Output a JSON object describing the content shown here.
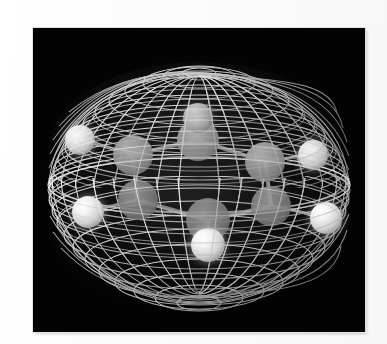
{
  "page": {
    "background_color": "#fdfdfd",
    "figure_background_color": "#030303",
    "alt_text": "Wireframe isosurface enclosing a benzene molecule, showing two electron-density lobes above and below the ring plane"
  },
  "figure": {
    "plate": {
      "x": 33,
      "y": 28,
      "width": 332,
      "height": 304
    },
    "molecule_formula": "C6H6",
    "molecule_name": "benzene",
    "surface_type": "wireframe isosurface",
    "lobe_count": 2,
    "lobes": [
      "upper lobe",
      "lower lobe"
    ],
    "mesh_color": "#d5d5d5",
    "carbon_color": "#8a8a8a",
    "hydrogen_color": "#f2f2f2",
    "bond_color": "#b9b9b9"
  },
  "chart_data": {
    "type": "scatter",
    "xlabel": "",
    "ylabel": "",
    "grid": false,
    "legend": "none",
    "xlim": [
      0,
      332
    ],
    "ylim": [
      0,
      304
    ],
    "annotations": [
      "wireframe isosurface, two lobes above and below the ring plane",
      "six carbon atoms form the planar hexagonal ring",
      "six hydrogen atoms point radially outward"
    ],
    "series": [
      {
        "name": "hydrogen",
        "label": "H",
        "count": 6,
        "radius": 14,
        "color": "#f2f2f2",
        "points": [
          {
            "id": "H1",
            "x": 47,
            "y": 112,
            "r": 15,
            "brightness": "mid"
          },
          {
            "id": "H2",
            "x": 55,
            "y": 184,
            "r": 16,
            "brightness": "bright"
          },
          {
            "id": "H3",
            "x": 165,
            "y": 90,
            "r": 15,
            "brightness": "dim"
          },
          {
            "id": "H4",
            "x": 175,
            "y": 217,
            "r": 17,
            "brightness": "bright"
          },
          {
            "id": "H5",
            "x": 280,
            "y": 127,
            "r": 15,
            "brightness": "mid"
          },
          {
            "id": "H6",
            "x": 293,
            "y": 190,
            "r": 16,
            "brightness": "bright"
          }
        ]
      },
      {
        "name": "carbon",
        "label": "C",
        "count": 6,
        "radius": 19,
        "color": "#8a8a8a",
        "points": [
          {
            "id": "C1",
            "x": 100,
            "y": 127,
            "r": 20,
            "brightness": "mid"
          },
          {
            "id": "C2",
            "x": 165,
            "y": 112,
            "r": 21,
            "brightness": "mid"
          },
          {
            "id": "C3",
            "x": 232,
            "y": 134,
            "r": 20,
            "brightness": "mid"
          },
          {
            "id": "C4",
            "x": 238,
            "y": 178,
            "r": 20,
            "brightness": "mid"
          },
          {
            "id": "C5",
            "x": 175,
            "y": 192,
            "r": 22,
            "brightness": "mid"
          },
          {
            "id": "C6",
            "x": 105,
            "y": 172,
            "r": 20,
            "brightness": "mid"
          }
        ]
      },
      {
        "name": "bonds",
        "label": "C-C and C-H bonds",
        "count": 12,
        "color": "#b9b9b9",
        "segments": [
          {
            "from": "C1",
            "to": "C2"
          },
          {
            "from": "C2",
            "to": "C3"
          },
          {
            "from": "C3",
            "to": "C4"
          },
          {
            "from": "C4",
            "to": "C5"
          },
          {
            "from": "C5",
            "to": "C6"
          },
          {
            "from": "C6",
            "to": "C1"
          },
          {
            "from": "C1",
            "to": "H1"
          },
          {
            "from": "C2",
            "to": "H3"
          },
          {
            "from": "C3",
            "to": "H5"
          },
          {
            "from": "C4",
            "to": "H6"
          },
          {
            "from": "C5",
            "to": "H4"
          },
          {
            "from": "C6",
            "to": "H2"
          }
        ]
      }
    ],
    "surface": {
      "name": "isosurface mesh",
      "style": "quadrilateral wire grid",
      "upper_lobe": {
        "cx": 166,
        "cy": 118,
        "rx": 152,
        "ry": 88
      },
      "lower_lobe": {
        "cx": 166,
        "cy": 196,
        "rx": 152,
        "ry": 92
      },
      "longitude_lines": 30,
      "latitude_lines": 14
    }
  }
}
